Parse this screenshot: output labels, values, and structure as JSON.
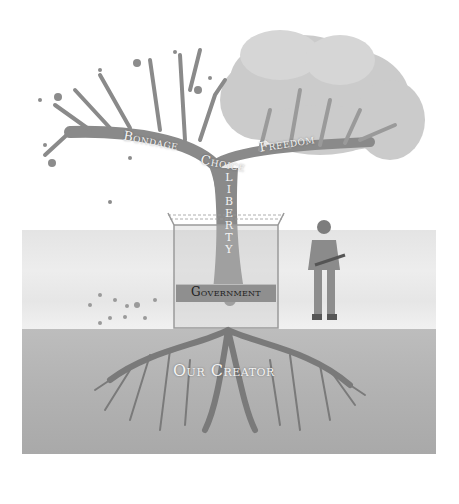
{
  "diagram": {
    "type": "illustration",
    "colors": {
      "background": "#ffffff",
      "ground_upper": "#e8e8e8",
      "ground_lower": "#b0b0b0",
      "trunk": "#8a8a8a",
      "roots": "#7a7a7a",
      "foliage": "#c9c9c9",
      "label_text_light": "#f4f4f4",
      "government_band": "#8f8f8f",
      "government_text": "#1f1f1f"
    },
    "labels": {
      "branch_left": "Bondage",
      "branch_center": "Choice",
      "branch_right": "Freedom",
      "trunk_vertical": [
        "L",
        "I",
        "B",
        "E",
        "R",
        "T",
        "Y"
      ],
      "fence_band": "Government",
      "roots": "Our Creator"
    },
    "elements": {
      "left_canopy": "bare branches with few dying leaves",
      "right_canopy": "full blossoming foliage",
      "fence": "chain-link fence with barbed wire around trunk",
      "soldier": "armed soldier standing guard",
      "fallen_leaves": "scattered leaves on ground at left"
    }
  }
}
